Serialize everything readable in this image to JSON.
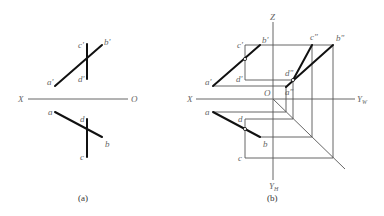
{
  "figure_a": {
    "caption": "(a)",
    "axis": {
      "x_label": "X",
      "o_label": "O"
    },
    "labels": {
      "a_prime": "a'",
      "b_prime": "b'",
      "c_prime": "c'",
      "d_prime": "d'",
      "a": "a",
      "b": "b",
      "c": "c",
      "d": "d"
    }
  },
  "figure_b": {
    "caption": "(b)",
    "axis": {
      "z_label": "Z",
      "x_label": "X",
      "o_label": "O",
      "yw_label": "Y",
      "yw_sub": "W",
      "yh_label": "Y",
      "yh_sub": "H"
    },
    "labels": {
      "a_prime": "a'",
      "b_prime": "b'",
      "c_prime": "c'",
      "d_prime": "d'",
      "a_dprime": "a\"",
      "b_dprime": "b\"",
      "c_dprime": "c\"",
      "d_dprime": "d\"",
      "a": "a",
      "b": "b",
      "c": "c",
      "d": "d"
    }
  },
  "colors": {
    "line": "#111111",
    "axis": "#666666",
    "label": "#666666"
  }
}
